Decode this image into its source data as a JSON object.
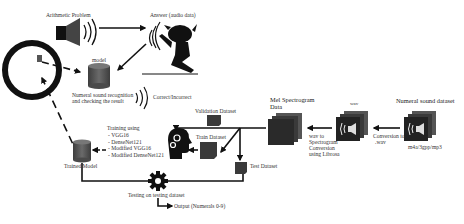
{
  "diagram": {
    "colors": {
      "line": "#111111",
      "dark_fill": "#1a1a1a",
      "cylinder_fill": "#555555",
      "box_fill": "#3a3a3a",
      "text": "#333333"
    },
    "nodes": {
      "arithmetic_problem": {
        "label": "Arithmetic Problem",
        "icon": "speaker-icon"
      },
      "answer": {
        "label": "Answer (audio data)",
        "icon": "speaking-person-icon"
      },
      "device": {
        "icon": "round-device-icon"
      },
      "model": {
        "label": "model",
        "icon": "database-cylinder-icon"
      },
      "recognition": {
        "label_line1": "Numeral sound recognition",
        "label_line2": "and checking the result"
      },
      "result": {
        "label": "Correct/Incorrect",
        "icon": "sound-waves-icon"
      },
      "trained_model": {
        "label": "Trained Model",
        "icon": "database-cylinder-icon"
      },
      "training": {
        "title": "Training using",
        "models": [
          "VGG16",
          "DenseNet121",
          "Modified VGG16",
          "Modified DenseNet121"
        ]
      },
      "brain": {
        "icon": "head-gears-icon"
      },
      "validation_dataset": {
        "label": "Validation Dataset"
      },
      "train_dataset": {
        "label": "Train Dataset"
      },
      "test_dataset": {
        "label": "Test Dataset"
      },
      "mel_spectrogram": {
        "label_line1": "Mel Spectrogram",
        "label_line2": "Data"
      },
      "wav": {
        "label": "wav",
        "icon": "speaker-stack-icon"
      },
      "numeral_dataset": {
        "label": "Numeral sound dataset",
        "sublabel": "m4a/3gpp/mp3",
        "icon": "speaker-stack-icon"
      },
      "wav_to_spec": {
        "lines": [
          "wav to",
          "Spectrogram",
          "Conversion",
          "using Librosa"
        ]
      },
      "conversion_wav": {
        "line1": "Conversion to",
        "line2": ".wav"
      },
      "testing": {
        "label": "Testing on testing dataset",
        "icon": "gear-icon"
      },
      "output": {
        "label": "Output (Numerals 0-9)"
      }
    }
  }
}
